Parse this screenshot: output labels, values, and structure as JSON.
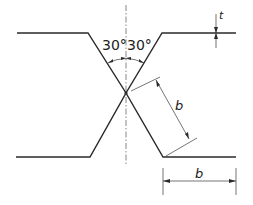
{
  "diagram": {
    "type": "double-V butt weld joint preparation (X-groove)",
    "labels": {
      "angle_left": "30°",
      "angle_right": "30°",
      "thickness": "t",
      "diagonal_dimension": "b",
      "horizontal_dimension": "b"
    },
    "colors": {
      "line": "#2a2a2a",
      "background": "#ffffff"
    }
  }
}
